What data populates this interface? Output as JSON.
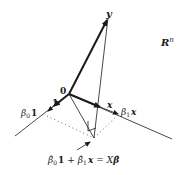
{
  "diagram": {
    "space_label": {
      "base": "R",
      "sup": "n"
    },
    "origin_label": "0",
    "vectors": {
      "y": {
        "label": "y"
      },
      "one": {
        "label": "1"
      },
      "x": {
        "label": "x"
      }
    },
    "scaled_labels": {
      "beta0_one": {
        "coef": "β",
        "sub": "0",
        "vec": "1"
      },
      "beta1_x": {
        "coef": "β",
        "sub": "1",
        "vec": "x"
      }
    },
    "fitted_formula": {
      "beta0hat": "β̂",
      "sub0": "0",
      "one": "1",
      "plus": "+",
      "beta1hat": "β̂",
      "sub1": "1",
      "x": "x",
      "eq": "=",
      "X": "X",
      "betahat": "β̂"
    },
    "colors": {
      "line": "#1a1a1a",
      "dotted": "#555555"
    }
  }
}
